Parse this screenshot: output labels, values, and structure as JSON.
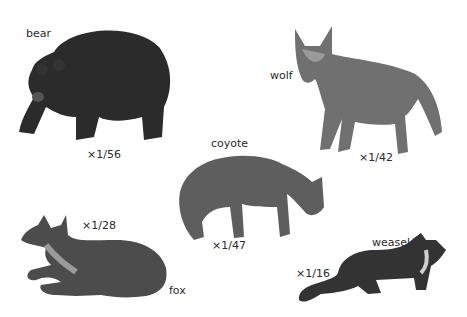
{
  "animals": [
    {
      "name": "bear",
      "scale": "×1/56",
      "color": "#2b2b2b"
    },
    {
      "name": "wolf",
      "scale": "×1/42",
      "color": "#6a6a6a"
    },
    {
      "name": "coyote",
      "scale": "×1/47",
      "color": "#5c5c5c"
    },
    {
      "name": "fox",
      "scale": "×1/28",
      "color": "#4a4a4a"
    },
    {
      "name": "weasel",
      "scale": "×1/16",
      "color": "#333333"
    }
  ]
}
